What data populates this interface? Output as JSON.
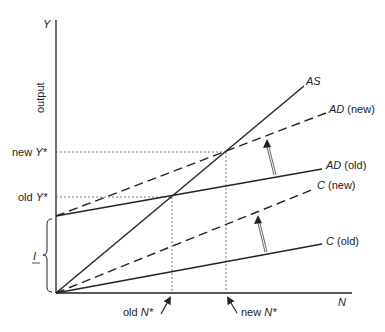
{
  "diagram": {
    "axes": {
      "y_axis_symbol": "Y",
      "y_axis_label": "output",
      "x_axis_symbol": "N"
    },
    "levels": {
      "new_y_star": {
        "prefix": "new ",
        "symbol": "Y*"
      },
      "old_y_star": {
        "prefix": "old ",
        "symbol": "Y*"
      },
      "investment": "I"
    },
    "employment": {
      "old_n_star": {
        "prefix": "old ",
        "symbol": "N*"
      },
      "new_n_star": {
        "prefix": "new ",
        "symbol": "N*"
      }
    },
    "lines": [
      {
        "id": "AS",
        "symbol": "AS",
        "suffix": "",
        "style": "solid"
      },
      {
        "id": "AD_new",
        "symbol": "AD",
        "suffix": " (new)",
        "style": "dashed"
      },
      {
        "id": "AD_old",
        "symbol": "AD",
        "suffix": " (old)",
        "style": "solid"
      },
      {
        "id": "C_new",
        "symbol": "C",
        "suffix": " (new)",
        "style": "dashed"
      },
      {
        "id": "C_old",
        "symbol": "C",
        "suffix": " (old)",
        "style": "solid"
      }
    ],
    "colors": {
      "ink": "#222222",
      "shift_arrow": "#666666",
      "guide": "#555555"
    }
  }
}
